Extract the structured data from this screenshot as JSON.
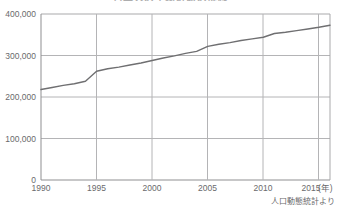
{
  "chart_data": {
    "type": "line",
    "title": "日本人の平均寿命の推移",
    "xlabel": "年",
    "ylabel": "",
    "xlim": [
      1990,
      2016
    ],
    "ylim": [
      0,
      400000
    ],
    "grid": true,
    "legend": false,
    "source_note": "人口動態統計より",
    "x_axis_unit_label": "(年)",
    "y_tick_labels": [
      "400,000",
      "300,000",
      "200,000",
      "100,000",
      "0"
    ],
    "y_tick_values": [
      400000,
      300000,
      200000,
      100000,
      0
    ],
    "x_tick_labels": [
      "1990",
      "1995",
      "2000",
      "2005",
      "2010",
      "2015"
    ],
    "x_tick_values": [
      1990,
      1995,
      2000,
      2005,
      2010,
      2015
    ],
    "series": [
      {
        "name": "件数",
        "color": "#6f6f71",
        "x": [
          1990,
          1991,
          1992,
          1993,
          1994,
          1995,
          1996,
          1997,
          1998,
          1999,
          2000,
          2001,
          2002,
          2003,
          2004,
          2005,
          2006,
          2007,
          2008,
          2009,
          2010,
          2011,
          2012,
          2013,
          2014,
          2015,
          2016
        ],
        "values": [
          218000,
          223000,
          228000,
          232000,
          238000,
          262000,
          268000,
          272000,
          277000,
          282000,
          288000,
          294000,
          299000,
          305000,
          310000,
          322000,
          327000,
          331000,
          336000,
          340000,
          344000,
          353000,
          356000,
          360000,
          364000,
          368000,
          373000
        ]
      }
    ]
  }
}
